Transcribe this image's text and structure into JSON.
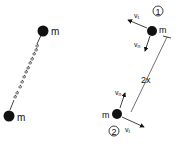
{
  "left_diagram": {
    "mass_top_label": "m",
    "mass_bottom_label": "m",
    "connector": "spring"
  },
  "right_diagram": {
    "body1": {
      "number": "1",
      "mass_label": "m",
      "vt_label": "v",
      "vt_sub": "t",
      "vn_label": "v",
      "vn_sub": "n"
    },
    "body2": {
      "number": "2",
      "mass_label": "m",
      "vt_label": "v",
      "vt_sub": "t",
      "vn_label": "v",
      "vn_sub": "n"
    },
    "distance_label": "2x"
  },
  "colors": {
    "ink": "#111111",
    "background": "#ffffff"
  }
}
